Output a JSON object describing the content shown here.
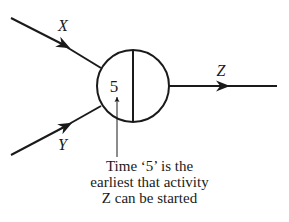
{
  "diagram": {
    "type": "activity-network-node",
    "node": {
      "earliest_time": "5",
      "latest_time": ""
    },
    "activities": [
      {
        "label": "X",
        "direction": "incoming"
      },
      {
        "label": "Y",
        "direction": "incoming"
      },
      {
        "label": "Z",
        "direction": "outgoing"
      }
    ],
    "annotation": {
      "lines": [
        "Time ‘5’ is the",
        "earliest that activity",
        "Z can be started"
      ]
    },
    "colors": {
      "stroke": "#1a1a1a",
      "background": "#ffffff"
    }
  }
}
